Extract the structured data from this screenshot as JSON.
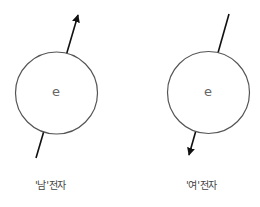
{
  "diagram": {
    "electrons": [
      {
        "id": "male",
        "symbol": "e",
        "label": "'남'전자",
        "spin_direction": "up",
        "circle": {
          "cx": 56.5,
          "cy": 93,
          "r": 41
        },
        "arrow": {
          "tail": [
            36,
            158
          ],
          "head": [
            78,
            14
          ]
        }
      },
      {
        "id": "female",
        "symbol": "e",
        "label": "'여'전자",
        "spin_direction": "down",
        "circle": {
          "cx": 208.5,
          "cy": 92.5,
          "r": 41
        },
        "arrow": {
          "tail": [
            229,
            14
          ],
          "head": [
            189,
            156
          ]
        }
      }
    ],
    "colors": {
      "stroke": "#555555",
      "arrow": "#111111",
      "text": "#444444"
    }
  }
}
